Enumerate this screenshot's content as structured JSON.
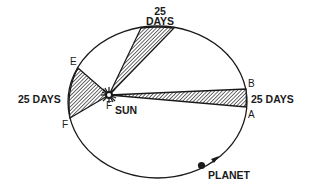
{
  "diagram": {
    "labels": {
      "top_wedge_line1": "25",
      "top_wedge_line2": "DAYS",
      "left_wedge": "25 DAYS",
      "right_wedge": "25 DAYS",
      "sun": "SUN",
      "planet": "PLANET",
      "point_a": "A",
      "point_b": "B",
      "point_e": "E",
      "point_f": "F",
      "focus": "F"
    },
    "colors": {
      "stroke": "#1a1a1a",
      "background": "#ffffff"
    }
  }
}
